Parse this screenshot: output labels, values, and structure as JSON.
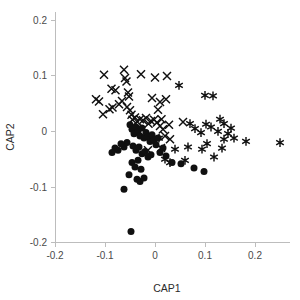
{
  "chart_data": {
    "type": "scatter",
    "title": "",
    "xlabel": "CAP1",
    "ylabel": "CAP2",
    "xlim": [
      -0.22,
      0.27
    ],
    "ylim": [
      -0.235,
      0.215
    ],
    "xticks": [
      -0.2,
      -0.1,
      0,
      0.1,
      0.2
    ],
    "xtick_labels": [
      "-0.2",
      "-0.1",
      "0",
      "0.1",
      "0.2"
    ],
    "yticks": [
      -0.2,
      -0.1,
      0,
      0.1,
      0.2
    ],
    "ytick_labels": [
      "-0.2",
      "-0.1",
      "0",
      "0.1",
      "0.2"
    ],
    "grid": false,
    "legend": null,
    "marker_color": "#101010",
    "axis_color": "#bdbdbd",
    "series": [
      {
        "name": "group-cross",
        "marker": "x",
        "count": 44,
        "points": [
          [
            -0.102,
            0.102
          ],
          [
            -0.087,
            0.077
          ],
          [
            -0.079,
            0.074
          ],
          [
            -0.062,
            0.111
          ],
          [
            -0.06,
            0.096
          ],
          [
            -0.057,
            0.09
          ],
          [
            -0.054,
            0.07
          ],
          [
            -0.052,
            0.063
          ],
          [
            -0.066,
            0.055
          ],
          [
            -0.072,
            0.049
          ],
          [
            -0.085,
            0.043
          ],
          [
            -0.091,
            0.04
          ],
          [
            -0.104,
            0.031
          ],
          [
            -0.112,
            0.054
          ],
          [
            -0.118,
            0.058
          ],
          [
            -0.056,
            0.044
          ],
          [
            -0.05,
            0.038
          ],
          [
            -0.047,
            0.03
          ],
          [
            -0.045,
            0.021
          ],
          [
            -0.04,
            0.025
          ],
          [
            -0.036,
            0.018
          ],
          [
            -0.03,
            0.022
          ],
          [
            -0.024,
            0.02
          ],
          [
            -0.018,
            0.024
          ],
          [
            -0.013,
            0.014
          ],
          [
            -0.008,
            0.019
          ],
          [
            -0.002,
            0.021
          ],
          [
            0.004,
            0.016
          ],
          [
            0.01,
            0.01
          ],
          [
            0.013,
            0.022
          ],
          [
            0.016,
            0.004
          ],
          [
            -0.028,
            0.103
          ],
          [
            0.0,
            0.097
          ],
          [
            0.024,
            0.1
          ],
          [
            -0.006,
            0.06
          ],
          [
            0.01,
            0.053
          ],
          [
            0.006,
            0.039
          ],
          [
            0.022,
            0.058
          ],
          [
            0.028,
            0.012
          ],
          [
            0.02,
            -0.008
          ],
          [
            0.03,
            -0.014
          ],
          [
            0.012,
            -0.03
          ],
          [
            -0.014,
            -0.034
          ],
          [
            0.056,
            0.017
          ]
        ]
      },
      {
        "name": "group-star",
        "marker": "asterisk",
        "count": 27,
        "points": [
          [
            0.048,
            0.083
          ],
          [
            0.1,
            0.065
          ],
          [
            0.116,
            0.064
          ],
          [
            0.07,
            0.014
          ],
          [
            0.102,
            0.013
          ],
          [
            0.13,
            0.022
          ],
          [
            0.138,
            0.014
          ],
          [
            0.126,
            0.0
          ],
          [
            0.092,
            -0.002
          ],
          [
            0.146,
            -0.004
          ],
          [
            0.08,
            0.005
          ],
          [
            0.112,
            0.008
          ],
          [
            0.138,
            -0.014
          ],
          [
            0.158,
            -0.012
          ],
          [
            0.104,
            -0.022
          ],
          [
            0.066,
            -0.028
          ],
          [
            0.094,
            -0.032
          ],
          [
            0.134,
            -0.03
          ],
          [
            0.04,
            -0.032
          ],
          [
            0.02,
            -0.05
          ],
          [
            0.06,
            -0.052
          ],
          [
            0.03,
            -0.056
          ],
          [
            0.182,
            -0.018
          ],
          [
            0.152,
            0.006
          ],
          [
            0.118,
            -0.046
          ],
          [
            0.008,
            -0.012
          ],
          [
            0.25,
            -0.02
          ]
        ]
      },
      {
        "name": "group-circle",
        "marker": "o",
        "count": 45,
        "points": [
          [
            -0.05,
            0.012
          ],
          [
            -0.046,
            0.004
          ],
          [
            -0.042,
            -0.004
          ],
          [
            -0.038,
            0.008
          ],
          [
            -0.034,
            0.0
          ],
          [
            -0.03,
            -0.008
          ],
          [
            -0.026,
            0.006
          ],
          [
            -0.022,
            -0.012
          ],
          [
            -0.018,
            -0.002
          ],
          [
            -0.014,
            -0.01
          ],
          [
            -0.01,
            -0.018
          ],
          [
            -0.006,
            -0.006
          ],
          [
            -0.002,
            -0.016
          ],
          [
            0.002,
            -0.024
          ],
          [
            0.006,
            -0.012
          ],
          [
            -0.056,
            -0.02
          ],
          [
            -0.062,
            -0.028
          ],
          [
            -0.068,
            -0.022
          ],
          [
            -0.074,
            -0.034
          ],
          [
            -0.08,
            -0.03
          ],
          [
            -0.086,
            -0.038
          ],
          [
            -0.044,
            -0.026
          ],
          [
            -0.038,
            -0.034
          ],
          [
            -0.032,
            -0.028
          ],
          [
            -0.026,
            -0.04
          ],
          [
            -0.02,
            -0.036
          ],
          [
            -0.014,
            -0.046
          ],
          [
            -0.008,
            -0.042
          ],
          [
            0.01,
            -0.038
          ],
          [
            0.016,
            -0.03
          ],
          [
            0.022,
            -0.044
          ],
          [
            -0.046,
            -0.056
          ],
          [
            -0.04,
            -0.064
          ],
          [
            -0.034,
            -0.052
          ],
          [
            -0.028,
            -0.068
          ],
          [
            -0.052,
            -0.078
          ],
          [
            -0.036,
            -0.086
          ],
          [
            -0.03,
            -0.09
          ],
          [
            -0.022,
            -0.084
          ],
          [
            -0.062,
            -0.104
          ],
          [
            0.034,
            -0.056
          ],
          [
            0.052,
            -0.058
          ],
          [
            0.078,
            -0.066
          ],
          [
            0.098,
            -0.072
          ],
          [
            -0.048,
            -0.18
          ]
        ]
      }
    ]
  }
}
